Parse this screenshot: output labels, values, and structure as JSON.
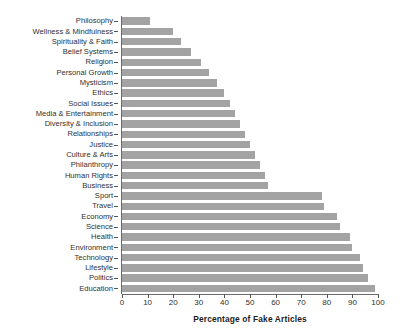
{
  "chart_data": {
    "type": "bar",
    "orientation": "horizontal",
    "title": "",
    "subtitle": "",
    "xlabel": "Percentage of Fake Articles",
    "ylabel": "",
    "xlim": [
      0,
      100
    ],
    "xticks": [
      0,
      10,
      20,
      30,
      40,
      50,
      60,
      70,
      80,
      90,
      100
    ],
    "grid": false,
    "legend": null,
    "bar_color": "#a3a3a3",
    "categories": [
      "Philosophy",
      "Wellness & Mindfulness",
      "Spirituality & Faith",
      "Belief Systems",
      "Religion",
      "Personal Growth",
      "Mysticism",
      "Ethics",
      "Social Issues",
      "Media & Entertainment",
      "Diversity & Inclusion",
      "Relationships",
      "Justice",
      "Culture & Arts",
      "Philanthropy",
      "Human Rights",
      "Business",
      "Sport",
      "Travel",
      "Economy",
      "Science",
      "Health",
      "Environment",
      "Technology",
      "Lifestyle",
      "Politics",
      "Education"
    ],
    "values": [
      11,
      20,
      23,
      27,
      31,
      34,
      37,
      40,
      42,
      44,
      46,
      48,
      50,
      52,
      54,
      56,
      57,
      78,
      79,
      84,
      85,
      89,
      90,
      93,
      94,
      96,
      99
    ]
  },
  "axis": {
    "x_title": "Percentage of Fake Articles",
    "tick_labels": [
      "0",
      "10",
      "20",
      "30",
      "40",
      "50",
      "60",
      "70",
      "80",
      "90",
      "100"
    ]
  }
}
